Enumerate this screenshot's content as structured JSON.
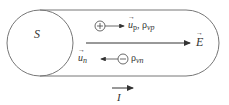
{
  "diagram": {
    "surface_label": "S",
    "positive_charge": {
      "symbol": "+",
      "velocity": "u",
      "velocity_sub": "p",
      "density": "ρ",
      "density_sub": "vp",
      "separator": ","
    },
    "negative_charge": {
      "symbol": "−",
      "velocity": "u",
      "velocity_sub": "n",
      "density": "ρ",
      "density_sub": "vn"
    },
    "field_label": "E",
    "current_label": "I",
    "colors": {
      "stroke": "#555555",
      "text": "#333333"
    }
  }
}
